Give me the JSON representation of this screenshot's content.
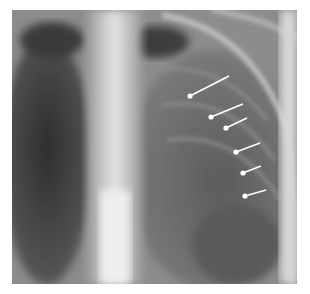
{
  "image": {
    "subject": "chest radiograph (frontal view, upper chest)",
    "frame": {
      "x": 12,
      "y": 10,
      "width": 285,
      "height": 274
    },
    "background_color": "#ffffff"
  },
  "annotations": {
    "arrow_color": "#ffffff",
    "arrows": [
      {
        "x1": 229,
        "y1": 76,
        "x2": 190,
        "y2": 96
      },
      {
        "x1": 243,
        "y1": 104,
        "x2": 211,
        "y2": 117
      },
      {
        "x1": 247,
        "y1": 118,
        "x2": 226,
        "y2": 128
      },
      {
        "x1": 260,
        "y1": 143,
        "x2": 236,
        "y2": 152
      },
      {
        "x1": 261,
        "y1": 166,
        "x2": 243,
        "y2": 173
      },
      {
        "x1": 266,
        "y1": 190,
        "x2": 245,
        "y2": 196
      }
    ]
  }
}
